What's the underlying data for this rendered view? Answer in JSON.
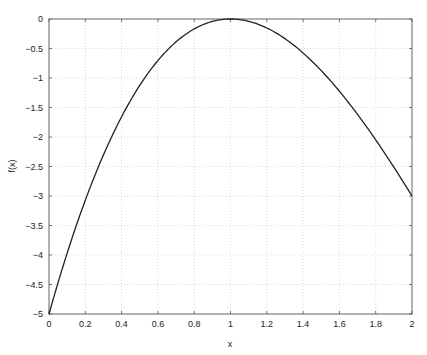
{
  "chart_data": {
    "type": "line",
    "title": "",
    "xlabel": "x",
    "ylabel": "f(x)",
    "xlim": [
      0,
      2
    ],
    "ylim": [
      -5,
      0
    ],
    "grid": true,
    "legend": null,
    "x_ticks": [
      "0",
      "0.2",
      "0.4",
      "0.6",
      "0.8",
      "1",
      "1.2",
      "1.4",
      "1.6",
      "1.8",
      "2"
    ],
    "y_ticks": [
      "0",
      "-0.5",
      "-1",
      "-1.5",
      "-2",
      "-2.5",
      "-3",
      "-3.5",
      "-4",
      "-4.5",
      "-5"
    ],
    "series": [
      {
        "name": "f(x)",
        "color": "#222222",
        "x": [
          0,
          0.1,
          0.2,
          0.3,
          0.4,
          0.5,
          0.6,
          0.7,
          0.8,
          0.9,
          1.0,
          1.1,
          1.2,
          1.3,
          1.4,
          1.5,
          1.6,
          1.7,
          1.8,
          1.9,
          2.0
        ],
        "values": [
          -5.0,
          -3.969,
          -3.072,
          -2.303,
          -1.656,
          -1.125,
          -0.704,
          -0.387,
          -0.168,
          -0.041,
          0.0,
          -0.039,
          -0.152,
          -0.333,
          -0.576,
          -0.875,
          -1.224,
          -1.617,
          -2.048,
          -2.511,
          -3.0
        ]
      }
    ]
  }
}
